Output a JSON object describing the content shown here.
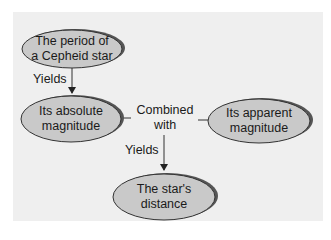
{
  "diagram": {
    "nodes": [
      {
        "id": "cepheid-period",
        "label_line1": "The period of",
        "label_line2": "a Cepheid star"
      },
      {
        "id": "absolute-magnitude",
        "label_line1": "Its absolute",
        "label_line2": "magnitude"
      },
      {
        "id": "apparent-magnitude",
        "label_line1": "Its apparent",
        "label_line2": "magnitude"
      },
      {
        "id": "star-distance",
        "label_line1": "The star's",
        "label_line2": "distance"
      }
    ],
    "edges": [
      {
        "from": "cepheid-period",
        "to": "absolute-magnitude",
        "label": "Yields"
      },
      {
        "from": "absolute-magnitude",
        "to": "apparent-magnitude",
        "label_line1": "Combined",
        "label_line2": "with"
      },
      {
        "from": "combined",
        "to": "star-distance",
        "label": "Yields"
      }
    ],
    "colors": {
      "background": "#efefef",
      "node_fill": "#c9c9c9",
      "node_shadow": "#555555",
      "stroke": "#333333"
    }
  }
}
